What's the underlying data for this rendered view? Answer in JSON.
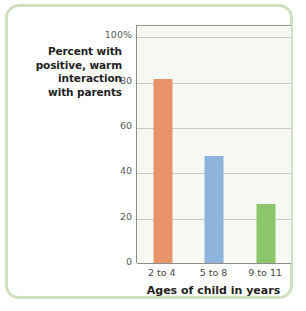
{
  "figure": {
    "border_color": "#cfdfc0",
    "plot_background": "#f5f8f3"
  },
  "y_caption": {
    "lines": [
      "Percent with",
      "positive, warm",
      "interaction",
      "with parents"
    ]
  },
  "chart_data": {
    "type": "bar",
    "title": "",
    "subtitle": "",
    "xlabel": "Ages of child in years",
    "ylabel": "Percent with positive, warm interaction with parents",
    "categories": [
      "2 to 4",
      "5 to 8",
      "9 to 11"
    ],
    "values": [
      81,
      47,
      26
    ],
    "bar_colors": [
      "#e8926a",
      "#8fb4dc",
      "#8dc56b"
    ],
    "ylim": [
      0,
      105
    ],
    "yticks": [
      0,
      20,
      40,
      60,
      80,
      100
    ],
    "ytick_labels": [
      "0",
      "20",
      "40",
      "60",
      "80",
      "100%"
    ],
    "grid": true,
    "grid_axis": "y",
    "legend": false,
    "legend_position": "none"
  }
}
